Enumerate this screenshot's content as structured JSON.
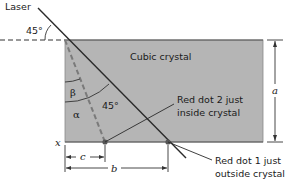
{
  "diagram": {
    "title_labels": {
      "laser": "Laser",
      "crystal": "Cubic crystal"
    },
    "angles": {
      "incident": "45°",
      "internal": "45°",
      "beta": "β",
      "alpha": "α"
    },
    "dimensions": {
      "a": "a",
      "b": "b",
      "c": "c",
      "x": "x"
    },
    "callouts": {
      "dot2_line1": "Red dot 2 just",
      "dot2_line2": "inside crystal",
      "dot1_line1": "Red dot 1 just",
      "dot1_line2": "outside crystal"
    },
    "colors": {
      "crystal_fill": "#b5b5b5",
      "crystal_edge": "#555555",
      "line": "#2a2a2a",
      "dashed_ray": "#7a7a7a",
      "dot": "#555555"
    }
  }
}
